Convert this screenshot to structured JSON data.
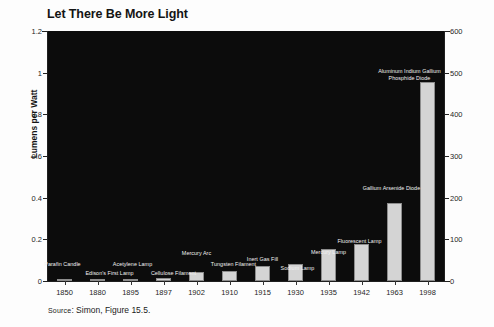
{
  "chart_data": {
    "type": "bar",
    "title": "Let There Be More Light",
    "xlabel": "",
    "ylabel": "Lumens per Watt",
    "ylabel_right": "",
    "ylim": [
      0,
      1.2
    ],
    "ylim_right": [
      0,
      600
    ],
    "yticks": [
      "0",
      "0.2",
      "0.4",
      "0.6",
      "0.8",
      "1",
      "1.2"
    ],
    "yticks_right": [
      "0",
      "100",
      "200",
      "300",
      "400",
      "500",
      "600"
    ],
    "grid": false,
    "legend": "none",
    "background": "#0c0c0c",
    "bar_color": "#d4d4d4",
    "categories": [
      "1850",
      "1880",
      "1895",
      "1897",
      "1902",
      "1910",
      "1915",
      "1930",
      "1935",
      "1942",
      "1963",
      "1998"
    ],
    "point_labels": [
      "Parafin Candle",
      "Edison's First Lamp",
      "Acetylene Lamp",
      "Cellulose Filament",
      "Mercury Arc",
      "Tungsten Filament",
      "Inert Gas Fill",
      "Sodium Lamp",
      "Mercury Lamp",
      "Fluorescent Lamp",
      "Gallium Arsenide Diode",
      "Aluminum Indium Gallium\nPhosphide Diode"
    ],
    "values": [
      0.006,
      0.008,
      0.012,
      0.016,
      0.044,
      0.05,
      0.072,
      0.084,
      0.156,
      0.176,
      0.376,
      0.956
    ],
    "values_right_scale": [
      3,
      4,
      6,
      8,
      22,
      25,
      36,
      42,
      78,
      88,
      188,
      478
    ],
    "bars": [
      {
        "year": "1850",
        "label": "Parafin Candle",
        "value": 0.006
      },
      {
        "year": "1880",
        "label": "Edison's First Lamp",
        "value": 0.008
      },
      {
        "year": "1895",
        "label": "Acetylene Lamp",
        "value": 0.012
      },
      {
        "year": "1897",
        "label": "Cellulose Filament",
        "value": 0.016
      },
      {
        "year": "1902",
        "label": "Mercury Arc",
        "value": 0.044
      },
      {
        "year": "1910",
        "label": "Tungsten Filament",
        "value": 0.05
      },
      {
        "year": "1915",
        "label": "Inert Gas Fill",
        "value": 0.072
      },
      {
        "year": "1930",
        "label": "Sodium Lamp",
        "value": 0.084
      },
      {
        "year": "1935",
        "label": "Mercury Lamp",
        "value": 0.156
      },
      {
        "year": "1942",
        "label": "Fluorescent Lamp",
        "value": 0.176
      },
      {
        "year": "1963",
        "label": "Gallium Arsenide Diode",
        "value": 0.376
      },
      {
        "year": "1998",
        "label": "Aluminum Indium Gallium Phosphide Diode",
        "value": 0.956
      }
    ]
  },
  "annotations": {
    "parafin_candle": "Parafin Candle",
    "edisons_first_lamp": "Edison's First Lamp",
    "acetylene_lamp": "Acetylene Lamp",
    "cellulose_filament": "Cellulose Filament",
    "mercury_arc": "Mercury Arc",
    "tungsten_filament": "Tungsten Filament",
    "inert_gas_fill": "Inert Gas Fill",
    "sodium_lamp": "Sodium Lamp",
    "mercury_lamp": "Mercury Lamp",
    "fluorescent_lamp": "Fluorescent Lamp",
    "gallium_arsenide_diode": "Gallium Arsenide Diode",
    "algainp_diode_line1": "Aluminum Indium Gallium",
    "algainp_diode_line2": "Phosphide Diode"
  },
  "footer": {
    "source_prefix": "Source",
    "source_text": ": Simon, Figure 15.5."
  }
}
